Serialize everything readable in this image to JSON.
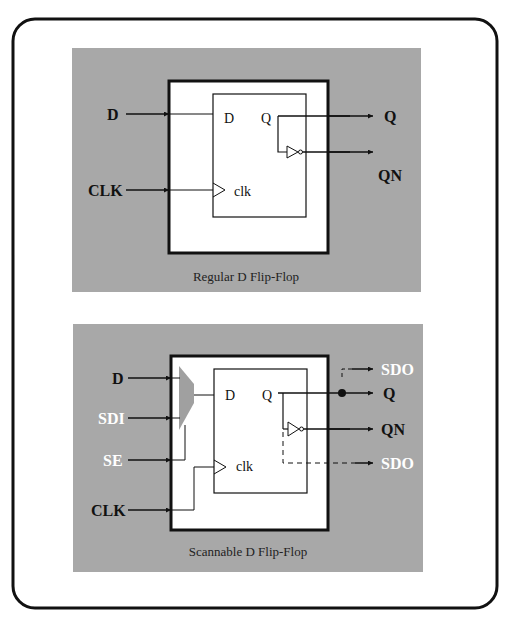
{
  "colors": {
    "panel_bg": "#a8a8a8",
    "wire": "#111111",
    "mux": "#a0a0a0",
    "scan_label": "#ffffff"
  },
  "regular": {
    "caption": "Regular D Flip-Flop",
    "inputs": [
      "D",
      "CLK"
    ],
    "outputs": [
      "Q",
      "QN"
    ],
    "pins": {
      "d": "D",
      "q": "Q",
      "clk": "clk"
    }
  },
  "scannable": {
    "caption": "Scannable D Flip-Flop",
    "inputs": [
      "D",
      "SDI",
      "SE",
      "CLK"
    ],
    "outputs": [
      "SDO",
      "Q",
      "QN",
      "SDO"
    ],
    "pins": {
      "d": "D",
      "q": "Q",
      "clk": "clk"
    }
  }
}
